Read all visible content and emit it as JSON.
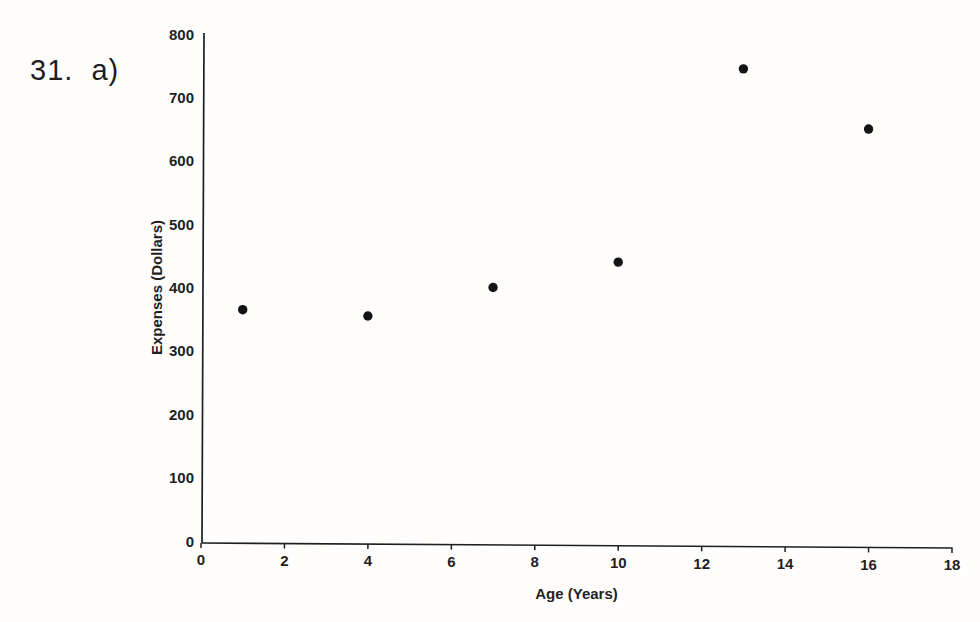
{
  "question_label": "31.  a)",
  "colors": {
    "ink": "#1f1f1f",
    "paper": "#fffefd",
    "point": "#141414"
  },
  "chart_data": {
    "type": "scatter",
    "title": "",
    "xlabel": "Age (Years)",
    "ylabel": "Expenses (Dollars)",
    "xlim": [
      0,
      18
    ],
    "ylim": [
      0,
      800
    ],
    "x_ticks": [
      0,
      2,
      4,
      6,
      8,
      10,
      12,
      14,
      16,
      18
    ],
    "y_ticks": [
      0,
      100,
      200,
      300,
      400,
      500,
      600,
      700,
      800
    ],
    "grid": false,
    "legend": false,
    "points": [
      {
        "x": 1,
        "y": 365
      },
      {
        "x": 4,
        "y": 355
      },
      {
        "x": 7,
        "y": 400
      },
      {
        "x": 10,
        "y": 440
      },
      {
        "x": 13,
        "y": 745
      },
      {
        "x": 16,
        "y": 650
      }
    ]
  }
}
